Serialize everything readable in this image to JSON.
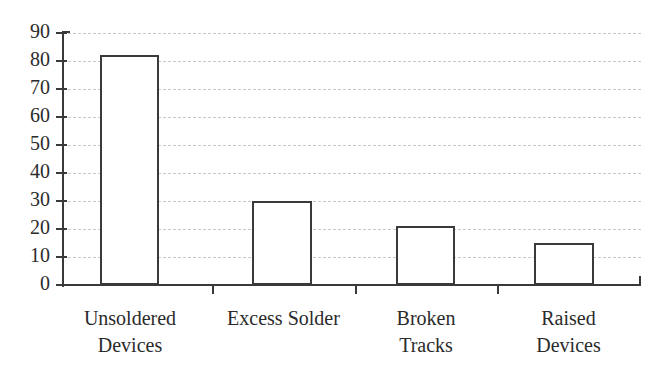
{
  "chart_data": {
    "type": "bar",
    "title": "",
    "subtitle": "",
    "xlabel": "",
    "ylabel": "",
    "categories": [
      "Unsoldered Devices",
      "Excess Solder",
      "Broken Tracks",
      "Raised Devices"
    ],
    "category_lines": [
      [
        "Unsoldered",
        "Devices"
      ],
      [
        "Excess Solder"
      ],
      [
        "Broken",
        "Tracks"
      ],
      [
        "Raised",
        "Devices"
      ]
    ],
    "values": [
      82,
      30,
      21,
      15
    ],
    "ylim": [
      0,
      90
    ],
    "ytick_step": 10,
    "yticks": [
      90,
      80,
      70,
      60,
      50,
      40,
      30,
      20,
      10,
      0
    ],
    "ytick_labels": [
      "90",
      "80",
      "70",
      "60",
      "50",
      "40",
      "30",
      "20",
      "10",
      "0"
    ],
    "grid": true,
    "grid_axis": "y",
    "grid_style": "dashed",
    "legend": false,
    "legend_position": "none",
    "bar_fill": "#ffffff",
    "bar_edge_color": "#3a3a3a",
    "axis_color": "#3a3a3a",
    "grid_color": "#c9c9c9",
    "text_color": "#2b2b2b",
    "background": "#ffffff"
  }
}
